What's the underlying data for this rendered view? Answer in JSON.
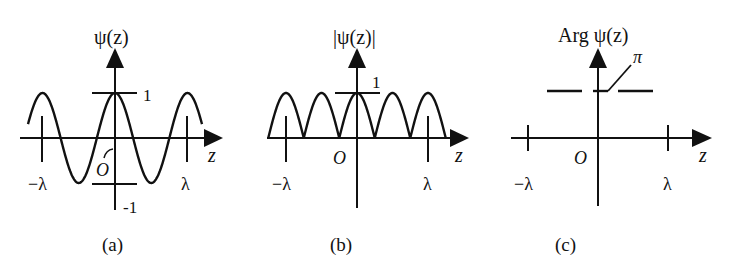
{
  "figure": {
    "panels": [
      {
        "id": "a",
        "title": "ψ(z)",
        "caption": "(a)",
        "x_axis_label": "z",
        "origin_label": "O",
        "tick_labels": {
          "neg_lambda": "−λ",
          "pos_lambda": "λ",
          "top": "1",
          "bottom": "-1"
        }
      },
      {
        "id": "b",
        "title": "|ψ(z)|",
        "caption": "(b)",
        "x_axis_label": "z",
        "origin_label": "O",
        "tick_labels": {
          "neg_lambda": "−λ",
          "pos_lambda": "λ",
          "top": "1"
        }
      },
      {
        "id": "c",
        "title": "Arg ψ(z)",
        "caption": "(c)",
        "x_axis_label": "z",
        "origin_label": "O",
        "tick_labels": {
          "neg_lambda": "−λ",
          "pos_lambda": "λ",
          "level": "π"
        }
      }
    ]
  },
  "chart_data": [
    {
      "type": "line",
      "title": "ψ(z)",
      "xlabel": "z",
      "ylabel": "ψ(z)",
      "function": "cos(2πz/λ)",
      "x_ticks": [
        "−λ",
        "O",
        "λ"
      ],
      "y_ticks": [
        "1",
        "-1"
      ],
      "ylim": [
        -1,
        1
      ],
      "x_range_lambda": [
        -1.2,
        1.2
      ]
    },
    {
      "type": "line",
      "title": "|ψ(z)|",
      "xlabel": "z",
      "ylabel": "|ψ(z)|",
      "function": "|cos(2πz/λ)|",
      "x_ticks": [
        "−λ",
        "O",
        "λ"
      ],
      "y_ticks": [
        "1"
      ],
      "ylim": [
        0,
        1
      ],
      "x_range_lambda": [
        -1.25,
        1.25
      ]
    },
    {
      "type": "line",
      "title": "Arg ψ(z)",
      "xlabel": "z",
      "ylabel": "Arg ψ(z)",
      "description": "Piecewise constant phase at level π (dashed segments)",
      "x_ticks": [
        "−λ",
        "O",
        "λ"
      ],
      "y_ticks": [
        "π"
      ],
      "level": "π"
    }
  ]
}
